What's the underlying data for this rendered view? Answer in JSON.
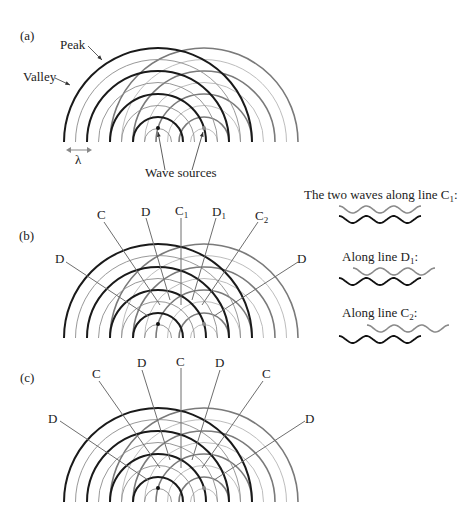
{
  "panels": [
    {
      "id": "a",
      "label": "(a)",
      "annotations": {
        "peak": "Peak",
        "valley": "Valley",
        "wavelength": "λ",
        "sources": "Wave sources"
      },
      "source_left": {
        "x": 158,
        "y": 142
      },
      "source_right": {
        "x": 204,
        "y": 142
      },
      "baseline_y": 142
    },
    {
      "id": "b",
      "label": "(b)",
      "lines": [
        "D",
        "C",
        "D",
        "C",
        "D",
        "C",
        "D"
      ],
      "line_labels": {
        "far_left": "D",
        "left": "C",
        "mid_left": "D",
        "center_main": "C",
        "center_sub": "1",
        "mid_right_main": "D",
        "mid_right_sub": "1",
        "right_main": "C",
        "right_sub": "2",
        "far_right": "D"
      },
      "source_left": {
        "x": 158,
        "y": 324
      },
      "source_right": {
        "x": 204,
        "y": 324
      },
      "baseline_y": 338
    },
    {
      "id": "c",
      "label": "(c)",
      "line_labels": {
        "far_left": "D",
        "left": "C",
        "mid_left": "D",
        "center": "C",
        "mid_right": "D",
        "right": "C",
        "far_right": "D"
      },
      "source_left": {
        "x": 158,
        "y": 488
      },
      "source_right": {
        "x": 204,
        "y": 488
      },
      "baseline_y": 502
    }
  ],
  "wave_insets": [
    {
      "title_main": "The two waves along line C",
      "title_sub": "1",
      "title_tail": ":",
      "phase": "in-phase"
    },
    {
      "title_main": "Along line D",
      "title_sub": "1",
      "title_tail": ":",
      "phase": "half-shift"
    },
    {
      "title_main": "Along line C",
      "title_sub": "2",
      "title_tail": ":",
      "phase": "full-shift"
    }
  ],
  "colors": {
    "peak": "#1a1a1a",
    "valley": "#8c8c8c",
    "right_source_wave": "#9a9a9a",
    "line": "#6e6e6e",
    "text": "#222222"
  }
}
